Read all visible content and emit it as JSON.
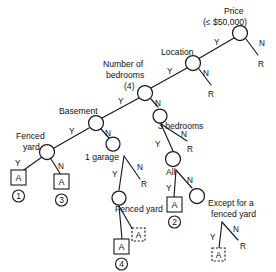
{
  "diagram": {
    "type": "decision-tree",
    "nodes": [
      {
        "id": "price",
        "label_lines": [
          "Price",
          "(≤ $50,000)"
        ]
      },
      {
        "id": "location",
        "label_lines": [
          "Location"
        ]
      },
      {
        "id": "bedrooms",
        "label_lines": [
          "Number of",
          "bedrooms",
          "(4)"
        ]
      },
      {
        "id": "basement",
        "label_lines": [
          "Basement"
        ]
      },
      {
        "id": "fenced_yard1",
        "label_lines": [
          "Fenced",
          "yard"
        ]
      },
      {
        "id": "garage",
        "label_lines": [
          "1 garage"
        ]
      },
      {
        "id": "fenced_yard2",
        "label_lines": [
          "Fenced yard"
        ]
      },
      {
        "id": "bedrooms3",
        "label_lines": [
          "3 bedrooms"
        ]
      },
      {
        "id": "all",
        "label_lines": [
          "All"
        ]
      },
      {
        "id": "except",
        "label_lines": [
          "Except for a",
          "fenced yard"
        ]
      }
    ],
    "branch_labels": {
      "yes": "Y",
      "no": "N",
      "reject": "R"
    },
    "leaf_label": "A",
    "leaf_numbers": [
      "1",
      "2",
      "3",
      "4"
    ],
    "colors": {
      "stroke": "#1a1a1a",
      "text": "#111111",
      "background": "#ffffff"
    }
  },
  "labels": {
    "price_l1": "Price",
    "price_l2": "(≤ $50,000)",
    "location": "Location",
    "bedrooms_l1": "Number of",
    "bedrooms_l2": "bedrooms",
    "bedrooms_l3": "(4)",
    "basement": "Basement",
    "fenced_yard_l1": "Fenced",
    "fenced_yard_l2": "yard",
    "garage": "1 garage",
    "fenced_yard2": "Fenced yard",
    "bedrooms3": "3 bedrooms",
    "all": "All",
    "except_l1": "Except for a",
    "except_l2": "fenced yard"
  },
  "branches": {
    "price_y": "Y",
    "price_n": "N",
    "price_r": "R",
    "location_y": "Y",
    "location_n": "N",
    "location_r": "R",
    "bedrooms_y": "Y",
    "bedrooms_n": "N",
    "basement_y": "Y",
    "basement_n": "N",
    "fy1_y": "Y",
    "fy1_n": "N",
    "garage_y": "Y",
    "garage_n": "N",
    "garage_r": "R",
    "b3_y": "Y",
    "b3_n": "N",
    "b3_r": "R",
    "all_y": "Y",
    "all_n": "N",
    "except_y": "Y",
    "except_n": "N",
    "except_r": "R"
  },
  "leaves": {
    "a1": "A",
    "a2": "A",
    "a3": "A",
    "a4": "A",
    "a5": "A",
    "a6": "A",
    "n1": "①",
    "n2": "②",
    "n3": "③",
    "n4": "④"
  }
}
